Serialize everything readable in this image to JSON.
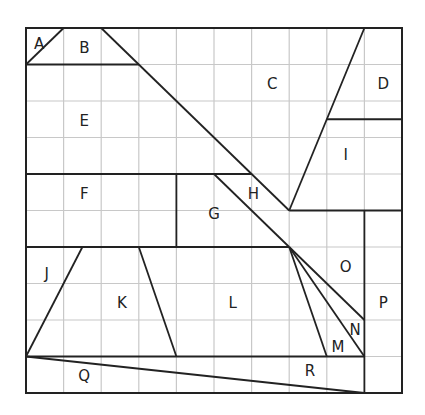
{
  "diagram": {
    "grid": {
      "cols": 10,
      "rows": 10,
      "x0": 26,
      "y0": 28,
      "x1": 402,
      "y1": 393,
      "grid_color": "#c8c8c8",
      "line_color": "#222222"
    },
    "segments": [
      [
        0,
        1,
        1,
        0
      ],
      [
        0,
        1,
        3,
        1
      ],
      [
        2,
        0,
        7,
        5
      ],
      [
        7,
        5,
        9,
        0
      ],
      [
        8,
        2.5,
        10,
        2.5
      ],
      [
        0,
        4,
        6,
        4
      ],
      [
        4,
        4,
        4,
        6
      ],
      [
        5,
        4,
        7,
        6
      ],
      [
        7,
        5,
        10,
        5
      ],
      [
        0,
        6,
        7,
        6
      ],
      [
        9,
        5,
        9,
        10
      ],
      [
        7,
        6,
        9,
        8
      ],
      [
        7,
        6,
        9,
        9
      ],
      [
        7,
        6,
        8,
        9
      ],
      [
        0,
        9,
        9,
        9
      ],
      [
        0,
        9,
        9,
        10
      ],
      [
        0,
        9,
        1.5,
        6
      ],
      [
        3,
        6,
        4,
        9
      ]
    ],
    "labels": [
      {
        "text": "A",
        "c": 0.35,
        "r": 0.45
      },
      {
        "text": "B",
        "c": 1.55,
        "r": 0.55
      },
      {
        "text": "C",
        "c": 6.55,
        "r": 1.55
      },
      {
        "text": "D",
        "c": 9.5,
        "r": 1.55
      },
      {
        "text": "E",
        "c": 1.55,
        "r": 2.55
      },
      {
        "text": "F",
        "c": 1.55,
        "r": 4.55
      },
      {
        "text": "G",
        "c": 5.0,
        "r": 5.1
      },
      {
        "text": "H",
        "c": 6.05,
        "r": 4.55
      },
      {
        "text": "I",
        "c": 8.5,
        "r": 3.5
      },
      {
        "text": "J",
        "c": 0.55,
        "r": 6.75
      },
      {
        "text": "K",
        "c": 2.55,
        "r": 7.55
      },
      {
        "text": "L",
        "c": 5.5,
        "r": 7.55
      },
      {
        "text": "M",
        "c": 8.3,
        "r": 8.75
      },
      {
        "text": "N",
        "c": 8.75,
        "r": 8.3
      },
      {
        "text": "O",
        "c": 8.5,
        "r": 6.55
      },
      {
        "text": "P",
        "c": 9.5,
        "r": 7.55
      },
      {
        "text": "Q",
        "c": 1.55,
        "r": 9.55
      },
      {
        "text": "R",
        "c": 7.55,
        "r": 9.4
      }
    ]
  }
}
